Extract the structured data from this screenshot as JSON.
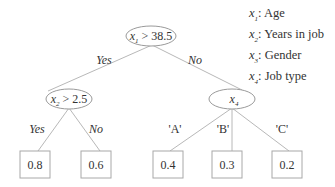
{
  "diagram": {
    "type": "decision-tree",
    "root": {
      "label_var": "x",
      "label_sub": "1",
      "label_cond": " > 38.5",
      "branches": {
        "yes": "Yes",
        "no": "No"
      }
    },
    "left_node": {
      "label_var": "x",
      "label_sub": "2",
      "label_cond": " > 2.5",
      "branches": {
        "yes": "Yes",
        "no": "No"
      }
    },
    "right_node": {
      "label_var": "x",
      "label_sub": "4",
      "branches": {
        "a": "'A'",
        "b": "'B'",
        "c": "'C'"
      }
    },
    "leaves": {
      "left_yes": "0.8",
      "left_no": "0.6",
      "right_a": "0.4",
      "right_b": "0.3",
      "right_c": "0.2"
    }
  },
  "legend": {
    "items": [
      {
        "var": "x",
        "sub": "1",
        "label": ": Age"
      },
      {
        "var": "x",
        "sub": "2",
        "label": ": Years in job"
      },
      {
        "var": "x",
        "sub": "3",
        "label": ": Gender"
      },
      {
        "var": "x",
        "sub": "4",
        "label": ": Job type"
      }
    ]
  }
}
